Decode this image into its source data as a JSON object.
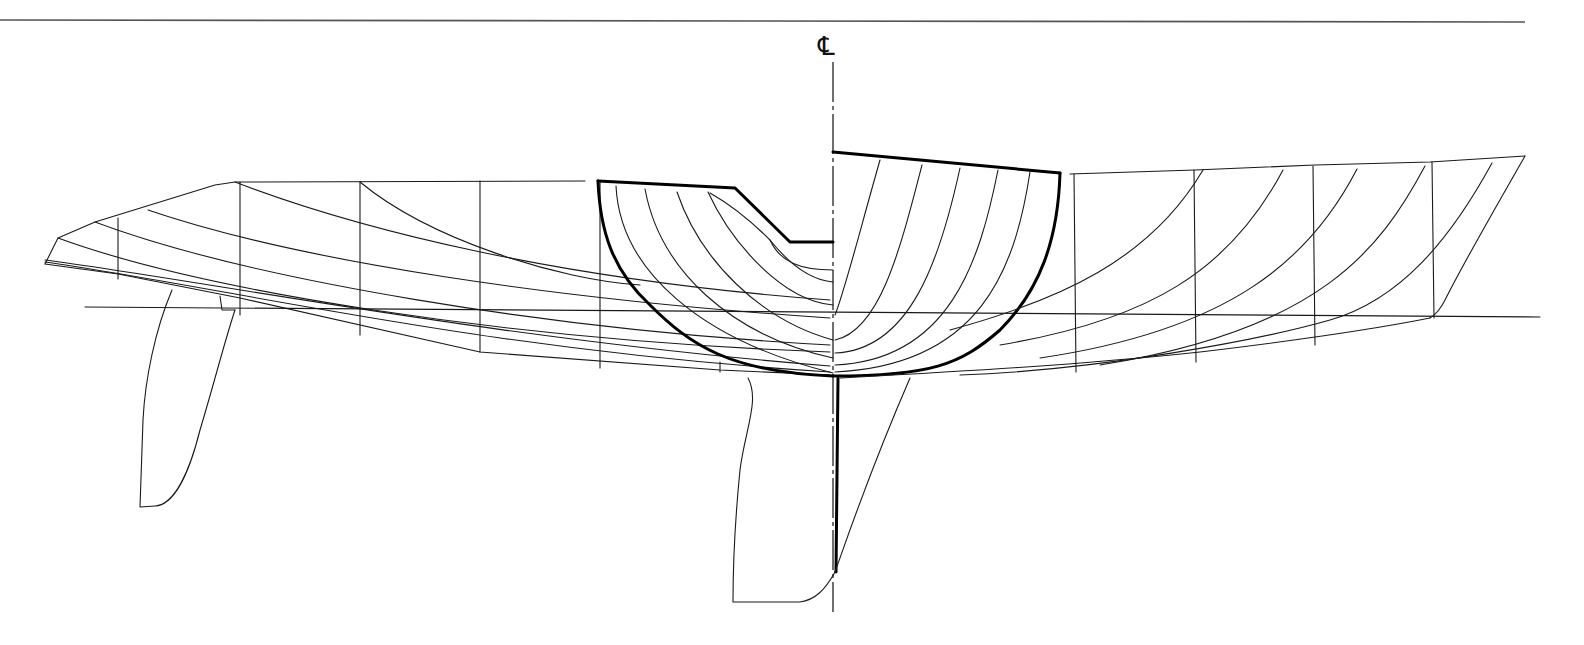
{
  "drawing": {
    "type": "naval architecture lines plan",
    "centerline_symbol": "℄",
    "views": [
      "profile / waterlines (aft, left)",
      "body plan sections (center)",
      "profile / buttocks (forward, right)"
    ],
    "annotations": []
  },
  "colors": {
    "ink": "#111111",
    "paper": "#ffffff",
    "frame": "#555555"
  }
}
